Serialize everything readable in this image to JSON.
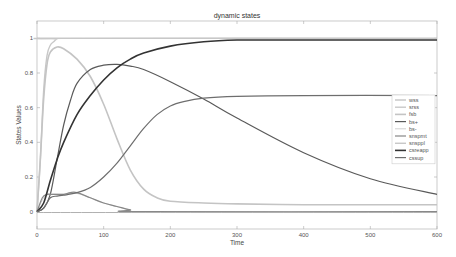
{
  "chart_data": {
    "type": "line",
    "title": "dynamic states",
    "xlabel": "Time",
    "ylabel": "States Values",
    "xlim": [
      0,
      600
    ],
    "ylim": [
      -0.1,
      1.1
    ],
    "xticks": [
      0,
      100,
      200,
      300,
      400,
      500,
      600
    ],
    "yticks": [
      0,
      0.2,
      0.4,
      0.6,
      0.8,
      1
    ],
    "ytick_labels": [
      "0",
      "0.2",
      "0.4",
      "0.6",
      "0.8",
      "1"
    ],
    "grid": false,
    "legend_position": "right",
    "series": [
      {
        "name": "wss",
        "color": "#bbbbbb",
        "width": 1.2,
        "x": [
          0,
          600
        ],
        "y": [
          1,
          1
        ]
      },
      {
        "name": "srss",
        "color": "#c8c8c8",
        "width": 1.4,
        "x": [
          0,
          5,
          10,
          15,
          20,
          25,
          30,
          40,
          600
        ],
        "y": [
          0,
          0.3,
          0.7,
          0.9,
          0.96,
          0.98,
          0.995,
          1,
          1
        ]
      },
      {
        "name": "fsb",
        "color": "#c4c4c4",
        "width": 1.6,
        "x": [
          0,
          5,
          10,
          15,
          20,
          30,
          40,
          60,
          80,
          100,
          120,
          140,
          160,
          180,
          200,
          250,
          300,
          400,
          500,
          600
        ],
        "y": [
          0,
          0.3,
          0.65,
          0.85,
          0.92,
          0.95,
          0.94,
          0.88,
          0.78,
          0.62,
          0.42,
          0.24,
          0.13,
          0.08,
          0.06,
          0.05,
          0.045,
          0.04,
          0.04,
          0.04
        ]
      },
      {
        "name": "bs+",
        "color": "#5a5a5a",
        "width": 1.2,
        "x": [
          0,
          10,
          20,
          30,
          40,
          50,
          60,
          80,
          100,
          120,
          140,
          160,
          200,
          250,
          300,
          400,
          500,
          600
        ],
        "y": [
          0,
          0.02,
          0.1,
          0.3,
          0.5,
          0.64,
          0.74,
          0.82,
          0.845,
          0.85,
          0.84,
          0.82,
          0.75,
          0.65,
          0.54,
          0.34,
          0.19,
          0.1
        ]
      },
      {
        "name": "bs-",
        "color": "#d0d0d0",
        "width": 1.0,
        "x": [
          0,
          10,
          20,
          40,
          60,
          80,
          100,
          140,
          160,
          600
        ],
        "y": [
          0,
          0.08,
          0.1,
          0.1,
          0.105,
          0.08,
          0.05,
          0.01,
          0,
          0
        ]
      },
      {
        "name": "snspmt",
        "color": "#888888",
        "width": 1.2,
        "x": [
          0,
          8,
          15,
          20,
          30,
          40,
          50,
          60,
          80,
          100,
          120,
          140,
          160,
          600
        ],
        "y": [
          0,
          0.08,
          0.1,
          0.1,
          0.1,
          0.1,
          0.11,
          0.11,
          0.08,
          0.05,
          0.03,
          0.01,
          0,
          0
        ]
      },
      {
        "name": "snsppl",
        "color": "#b0b0b0",
        "width": 1.0,
        "x": [
          0,
          600
        ],
        "y": [
          -0.005,
          -0.005
        ]
      },
      {
        "name": "csreapp",
        "color": "#333333",
        "width": 1.6,
        "x": [
          0,
          10,
          20,
          30,
          40,
          60,
          80,
          100,
          120,
          140,
          160,
          200,
          250,
          300,
          350,
          400,
          600
        ],
        "y": [
          0,
          0.05,
          0.18,
          0.3,
          0.4,
          0.56,
          0.67,
          0.76,
          0.83,
          0.88,
          0.915,
          0.955,
          0.98,
          0.99,
          0.99,
          0.99,
          0.99
        ]
      },
      {
        "name": "cssup",
        "color": "#6e6e6e",
        "width": 1.2,
        "x": [
          0,
          10,
          20,
          30,
          40,
          60,
          80,
          100,
          120,
          140,
          160,
          180,
          200,
          220,
          250,
          300,
          400,
          600
        ],
        "y": [
          0,
          0.02,
          0.08,
          0.09,
          0.095,
          0.11,
          0.14,
          0.2,
          0.28,
          0.38,
          0.48,
          0.56,
          0.61,
          0.635,
          0.655,
          0.665,
          0.67,
          0.67
        ]
      }
    ]
  }
}
